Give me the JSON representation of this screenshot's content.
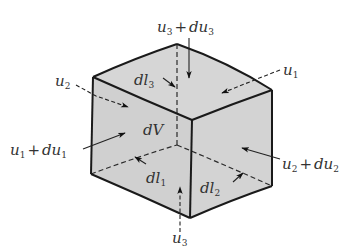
{
  "figure": {
    "fill_color": "#d4d4d4",
    "edge_color": "#1a1a1a",
    "labels": {
      "u3_top": {
        "base": "u",
        "sub": "3",
        "plus": "+",
        "d": "du",
        "dsub": "3"
      },
      "u1": {
        "base": "u",
        "sub": "1"
      },
      "u2": {
        "base": "u",
        "sub": "2"
      },
      "u1_plus": {
        "base": "u",
        "sub": "1",
        "plus": "+",
        "d": "du",
        "dsub": "1"
      },
      "u2_plus": {
        "base": "u",
        "sub": "2",
        "plus": "+",
        "d": "du",
        "dsub": "2"
      },
      "u3_bottom": {
        "base": "u",
        "sub": "3"
      },
      "dl1": {
        "base": "dl",
        "sub": "1"
      },
      "dl2": {
        "base": "dl",
        "sub": "2"
      },
      "dl3": {
        "base": "dl",
        "sub": "3"
      },
      "dV": {
        "text": "dV"
      }
    }
  }
}
